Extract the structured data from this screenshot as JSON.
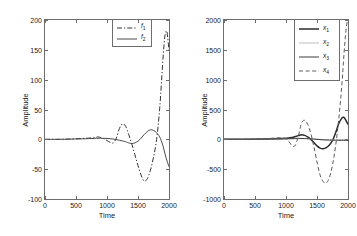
{
  "figure": {
    "panels": [
      {
        "id": "left",
        "xlabel": "Time",
        "ylabel": "Amplitude",
        "xticks": [
          "0",
          "500",
          "1000",
          "1500",
          "2000"
        ],
        "yticks": [
          "200",
          "150",
          "100",
          "50",
          "0",
          "-50",
          "-100"
        ],
        "legend": [
          {
            "label": "f",
            "sub": "1",
            "style": "dashdot"
          },
          {
            "label": "f",
            "sub": "2",
            "style": "solid"
          }
        ]
      },
      {
        "id": "right",
        "xlabel": "Time",
        "ylabel": "Amplitude",
        "xticks": [
          "0",
          "500",
          "1000",
          "1500",
          "2000"
        ],
        "yticks": [
          "2000",
          "1500",
          "1000",
          "500",
          "0",
          "-500",
          "-1000"
        ],
        "legend": [
          {
            "label": "x",
            "sub": "1",
            "style": "thick-solid"
          },
          {
            "label": "x",
            "sub": "2",
            "style": "faint"
          },
          {
            "label": "x",
            "sub": "3",
            "style": "solid"
          },
          {
            "label": "x",
            "sub": "4",
            "style": "dashed"
          }
        ]
      }
    ]
  },
  "chart_data": [
    {
      "type": "line",
      "title": "",
      "xlabel": "Time",
      "ylabel": "Amplitude",
      "xlim": [
        0,
        2000
      ],
      "ylim": [
        -100,
        200
      ],
      "xticks": [
        0,
        500,
        1000,
        1500,
        2000
      ],
      "yticks": [
        -100,
        -50,
        0,
        50,
        100,
        150,
        200
      ],
      "grid": false,
      "legend_position": "top-right",
      "series": [
        {
          "name": "f1",
          "linestyle": "dashdot",
          "color": "#333333",
          "x": [
            0,
            100,
            200,
            300,
            400,
            500,
            600,
            700,
            800,
            850,
            900,
            950,
            1000,
            1050,
            1100,
            1150,
            1200,
            1250,
            1300,
            1350,
            1400,
            1450,
            1500,
            1550,
            1600,
            1650,
            1700,
            1750,
            1800,
            1850,
            1900,
            1930,
            1960,
            1980,
            2000
          ],
          "y": [
            0,
            0,
            0,
            0.2,
            0.5,
            1,
            1.5,
            2,
            3,
            4,
            3,
            1,
            -2,
            -5,
            -6,
            2,
            18,
            26,
            22,
            8,
            -8,
            -26,
            -44,
            -60,
            -70,
            -66,
            -52,
            -30,
            0,
            52,
            130,
            170,
            182,
            170,
            148
          ]
        },
        {
          "name": "f2",
          "linestyle": "solid",
          "color": "#4a4a4a",
          "x": [
            0,
            200,
            400,
            600,
            800,
            900,
            1000,
            1100,
            1200,
            1300,
            1350,
            1400,
            1450,
            1500,
            1550,
            1600,
            1650,
            1700,
            1750,
            1800,
            1850,
            1900,
            1950,
            2000
          ],
          "y": [
            0,
            0,
            0.3,
            0.8,
            1.5,
            1.8,
            1.5,
            0.5,
            -1.5,
            -4,
            -6,
            -7,
            -6,
            -3,
            2,
            8,
            13,
            16,
            15,
            11,
            4,
            -10,
            -30,
            -46
          ]
        }
      ]
    },
    {
      "type": "line",
      "title": "",
      "xlabel": "Time",
      "ylabel": "Amplitude",
      "xlim": [
        0,
        2000
      ],
      "ylim": [
        -1000,
        2000
      ],
      "xticks": [
        0,
        500,
        1000,
        1500,
        2000
      ],
      "yticks": [
        -1000,
        -500,
        0,
        500,
        1000,
        1500,
        2000
      ],
      "grid": false,
      "legend_position": "top-right",
      "series": [
        {
          "name": "x1",
          "linestyle": "thick-solid",
          "color": "#2b2b2b",
          "x": [
            0,
            200,
            400,
            600,
            800,
            900,
            1000,
            1100,
            1200,
            1250,
            1300,
            1350,
            1400,
            1450,
            1500,
            1550,
            1600,
            1650,
            1700,
            1750,
            1800,
            1850,
            1900,
            1930,
            1960,
            2000
          ],
          "y": [
            0,
            0,
            2,
            5,
            10,
            14,
            18,
            30,
            62,
            75,
            66,
            40,
            0,
            -55,
            -110,
            -148,
            -158,
            -140,
            -95,
            -20,
            110,
            260,
            355,
            370,
            330,
            248
          ]
        },
        {
          "name": "x2",
          "linestyle": "faint",
          "color": "#bdbdbd",
          "x": [
            0,
            400,
            800,
            1000,
            1200,
            1400,
            1500,
            1600,
            1700,
            1800,
            1900,
            2000
          ],
          "y": [
            0,
            1,
            4,
            6,
            10,
            8,
            2,
            -8,
            -14,
            -12,
            -6,
            -4
          ]
        },
        {
          "name": "x3",
          "linestyle": "solid",
          "color": "#3d3d3d",
          "x": [
            0,
            300,
            600,
            900,
            1100,
            1200,
            1300,
            1400,
            1500,
            1600,
            1700,
            1800,
            1900,
            2000
          ],
          "y": [
            0,
            0,
            2,
            6,
            12,
            16,
            14,
            8,
            0,
            -8,
            -12,
            -14,
            -16,
            -18
          ]
        },
        {
          "name": "x4",
          "linestyle": "dashed",
          "color": "#5a5a5a",
          "x": [
            0,
            200,
            400,
            600,
            800,
            900,
            1000,
            1050,
            1100,
            1150,
            1200,
            1250,
            1300,
            1350,
            1400,
            1450,
            1500,
            1550,
            1600,
            1650,
            1700,
            1750,
            1800,
            1850,
            1900,
            1930,
            1960,
            1980,
            2000
          ],
          "y": [
            0,
            0,
            2,
            8,
            20,
            25,
            10,
            -40,
            -110,
            -100,
            60,
            270,
            320,
            250,
            100,
            -120,
            -380,
            -600,
            -710,
            -730,
            -640,
            -430,
            -110,
            330,
            900,
            1350,
            1750,
            1930,
            2000
          ]
        }
      ]
    }
  ]
}
